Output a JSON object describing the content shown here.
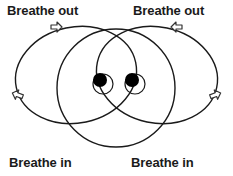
{
  "figure": {
    "type": "breathing-pattern-diagram",
    "title_visible": false,
    "background_color": "#ffffff",
    "stroke_color": "#1a1a1a",
    "marker_fill_color": "#000000",
    "labels": {
      "top_left": "Breathe out",
      "top_right": "Breathe out",
      "bottom_left": "Breathe in",
      "bottom_right": "Breathe in"
    },
    "arrows": [
      {
        "name": "arrow-top-left",
        "direction": "right",
        "x": 56,
        "y": 27
      },
      {
        "name": "arrow-top-right",
        "direction": "left",
        "x": 177,
        "y": 27
      },
      {
        "name": "arrow-left-side",
        "direction": "left",
        "x": 18,
        "y": 95
      },
      {
        "name": "arrow-right-side",
        "direction": "right",
        "x": 215,
        "y": 95
      }
    ],
    "shapes": {
      "center_circle": {
        "cx": 116,
        "cy": 88,
        "r": 59
      },
      "left_loop": {
        "cx": 76,
        "cy": 75,
        "rx": 61,
        "ry": 48,
        "rotation": -12
      },
      "right_loop": {
        "cx": 157,
        "cy": 75,
        "rx": 61,
        "ry": 48,
        "rotation": 12
      },
      "pupil_left": {
        "cx": 100,
        "cy": 81,
        "r": 7
      },
      "pupil_right": {
        "cx": 132,
        "cy": 81,
        "r": 7
      },
      "eye_left": {
        "cx": 103,
        "cy": 84,
        "r": 10
      },
      "eye_right": {
        "cx": 135,
        "cy": 84,
        "r": 10
      }
    }
  }
}
